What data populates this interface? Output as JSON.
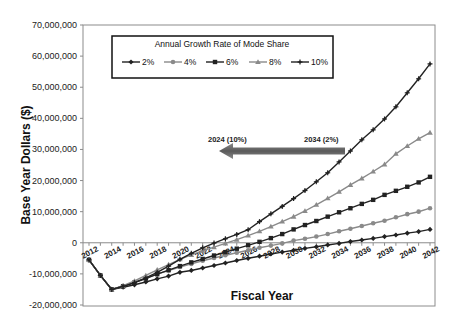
{
  "chart_data": {
    "type": "line",
    "title": "",
    "xlabel": "Fiscal Year",
    "ylabel": "Base Year Dollars ($)",
    "ylim": [
      -20000000,
      70000000
    ],
    "xlim": [
      2012,
      2042
    ],
    "grid": false,
    "y_ticks": [
      70000000,
      60000000,
      50000000,
      40000000,
      30000000,
      20000000,
      10000000,
      0,
      -10000000,
      -20000000
    ],
    "y_tick_labels": [
      "70,000,000",
      "60,000,000",
      "50,000,000",
      "40,000,000",
      "30,000,000",
      "20,000,000",
      "10,000,000",
      "0",
      "-10,000,000",
      "-20,000,000"
    ],
    "x_tick_labels": [
      "2012",
      "2014",
      "2016",
      "2018",
      "2020",
      "2022",
      "2024",
      "2026",
      "2028",
      "2030",
      "2032",
      "2034",
      "2036",
      "2038",
      "2040",
      "2042"
    ],
    "legend": {
      "title": "Annual Growth Rate of Mode Share",
      "position": "top-left inside plot",
      "entries": [
        "2%",
        "4%",
        "6%",
        "8%",
        "10%"
      ]
    },
    "x": [
      2012,
      2013,
      2014,
      2015,
      2016,
      2017,
      2018,
      2019,
      2020,
      2021,
      2022,
      2023,
      2024,
      2025,
      2026,
      2027,
      2028,
      2029,
      2030,
      2031,
      2032,
      2033,
      2034,
      2035,
      2036,
      2037,
      2038,
      2039,
      2040,
      2041,
      2042
    ],
    "series": [
      {
        "name": "2%",
        "color": "#222222",
        "marker": "diamond",
        "values": [
          -5500000,
          -10500000,
          -15000000,
          -14300000,
          -13500000,
          -12600000,
          -11600000,
          -10700000,
          -9500000,
          -8900000,
          -8100000,
          -7300000,
          -6500000,
          -5700000,
          -5000000,
          -4300000,
          -3600000,
          -3000000,
          -2400000,
          -1800000,
          -1300000,
          -700000,
          -200000,
          400000,
          900000,
          1400000,
          2000000,
          2500000,
          3100000,
          3600000,
          4300000
        ]
      },
      {
        "name": "4%",
        "color": "#8a8a8a",
        "marker": "circle",
        "values": [
          -5500000,
          -10500000,
          -15000000,
          -14000000,
          -12700000,
          -11400000,
          -10100000,
          -8900000,
          -7800000,
          -6800000,
          -5800000,
          -4900000,
          -4000000,
          -3200000,
          -2400000,
          -1600000,
          -900000,
          -200000,
          700000,
          1300000,
          2000000,
          2800000,
          3700000,
          4500000,
          5400000,
          6300000,
          7100000,
          8200000,
          9200000,
          10000000,
          11100000
        ]
      },
      {
        "name": "6%",
        "color": "#222222",
        "marker": "square",
        "values": [
          -5500000,
          -10500000,
          -15000000,
          -14000000,
          -12800000,
          -11500000,
          -10100000,
          -8800000,
          -7500000,
          -6300000,
          -5200000,
          -4100000,
          -3000000,
          -1900000,
          -800000,
          300000,
          1500000,
          2800000,
          4300000,
          5700000,
          7000000,
          8400000,
          9800000,
          11100000,
          12500000,
          13800000,
          15400000,
          16700000,
          18000000,
          19400000,
          21200000
        ]
      },
      {
        "name": "8%",
        "color": "#8a8a8a",
        "marker": "triangle",
        "values": [
          -5500000,
          -10500000,
          -15000000,
          -13800000,
          -12300000,
          -10500000,
          -8700000,
          -7000000,
          -5300000,
          -3900000,
          -2600000,
          -1400000,
          -200000,
          1000000,
          2300000,
          3700000,
          5200000,
          6800000,
          8400000,
          10200000,
          12200000,
          14300000,
          16400000,
          18600000,
          20700000,
          22900000,
          25200000,
          28600000,
          31100000,
          33400000,
          35400000
        ]
      },
      {
        "name": "10%",
        "color": "#222222",
        "marker": "plus",
        "values": [
          -5500000,
          -10500000,
          -15000000,
          -14000000,
          -12800000,
          -11300000,
          -9500000,
          -7500000,
          -5300000,
          -3400000,
          -1600000,
          -100000,
          1300000,
          2700000,
          4200000,
          6800000,
          9300000,
          11700000,
          14200000,
          16800000,
          19600000,
          22500000,
          26000000,
          29500000,
          33100000,
          36300000,
          39800000,
          43700000,
          48200000,
          52700000,
          57500000
        ]
      }
    ],
    "annotations": [
      {
        "type": "arrow",
        "direction": "left",
        "from_label": "2034 (2%)",
        "to_label": "2024 (10%)",
        "color": "#6b6b6b"
      }
    ]
  }
}
